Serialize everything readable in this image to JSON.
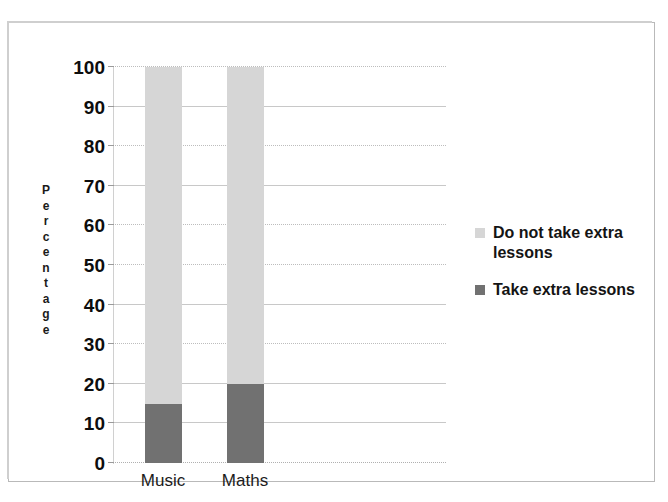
{
  "chart_data": {
    "type": "bar",
    "subtype": "stacked-bar",
    "title": "",
    "xlabel": "",
    "ylabel": "Percentage",
    "categories": [
      "Music",
      "Maths"
    ],
    "series": [
      {
        "name": "Take extra lessons",
        "color": "#717171",
        "values": [
          15,
          20
        ]
      },
      {
        "name": "Do not take extra lessons",
        "color": "#d6d6d6",
        "values": [
          85,
          80
        ]
      }
    ],
    "ylim": [
      0,
      100
    ],
    "y_ticks": [
      0,
      10,
      20,
      30,
      40,
      50,
      60,
      70,
      80,
      90,
      100
    ],
    "y_tick_labels": [
      "0",
      "10",
      "20",
      "30",
      "40",
      "50",
      "60",
      "70",
      "80",
      "90",
      "100"
    ],
    "grid": true,
    "legend_position": "right",
    "stack_order_bottom_to_top": [
      "Take extra lessons",
      "Do not take extra lessons"
    ]
  },
  "axis": {
    "y_title_letters": [
      "P",
      "e",
      "r",
      "c",
      "e",
      "n",
      "t",
      "a",
      "g",
      "e"
    ]
  },
  "legend": {
    "entries": [
      {
        "label": "Do not take extra lessons",
        "color": "#d6d6d6"
      },
      {
        "label": "Take extra lessons",
        "color": "#717171"
      }
    ]
  },
  "colors": {
    "light_segment": "#d6d6d6",
    "dark_segment": "#717171",
    "gridline": "#c8c8c8",
    "frame": "#b9b9b9",
    "text": "#141414"
  }
}
